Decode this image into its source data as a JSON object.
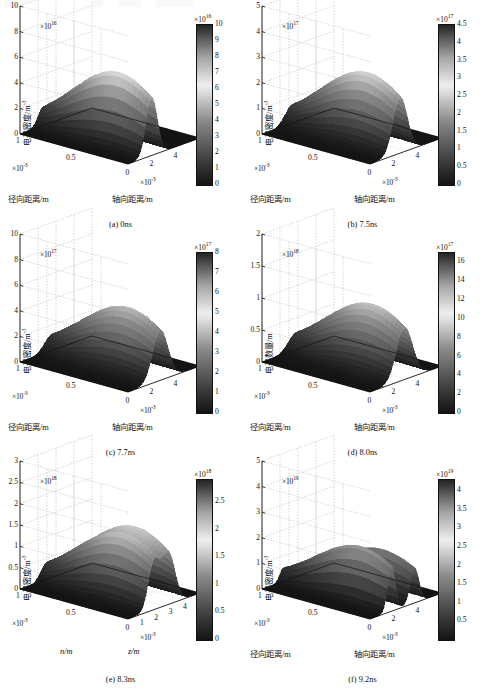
{
  "figure": {
    "type": "multi-panel-3d-surface-grid",
    "rows": 2,
    "cols": 3,
    "colormap": "grayscale-jet",
    "shared": {
      "zlabel": "电子密度/m",
      "zlabel_sup": "-3",
      "radial_label": "径向距离/m",
      "axial_label": "轴向距离/m",
      "radial_exp_text": "×10",
      "radial_exp_sup": "-3",
      "axial_exp_text": "×10",
      "axial_exp_sup": "-3",
      "exp_prefix": "×10"
    }
  },
  "panels": [
    {
      "id": "a",
      "caption": "(a) 0ns",
      "time": "0ns",
      "zlabel": "电子密度/m",
      "zlabel_sup": "-3",
      "xlabel": "径向距离/m",
      "ylabel": "轴向距离/m",
      "z_exp": "16",
      "cb_exp": "16",
      "z_ticks": [
        "0",
        "2",
        "4",
        "6",
        "8",
        "10"
      ],
      "z_values": [
        0,
        2,
        4,
        6,
        8,
        10
      ],
      "radial_ticks": [
        "1",
        "0.5"
      ],
      "axial_ticks": [
        "0",
        "2",
        "4",
        "6"
      ],
      "cb_ticks": [
        "0",
        "1",
        "2",
        "3",
        "4",
        "5",
        "6",
        "7",
        "8",
        "9",
        "10"
      ],
      "cb_range": [
        0,
        10
      ],
      "peaks": [
        {
          "z_center": 0.33,
          "r_center": 0.3,
          "height": 0.58,
          "width": 0.11
        }
      ]
    },
    {
      "id": "b",
      "caption": "(b) 7.5ns",
      "time": "7.5ns",
      "zlabel": "电子密度/m",
      "zlabel_sup": "-3",
      "xlabel": "径向距离/m",
      "ylabel": "轴向距离/m",
      "z_exp": "17",
      "cb_exp": "17",
      "z_ticks": [
        "0",
        "1",
        "2",
        "3",
        "4",
        "5"
      ],
      "z_values": [
        0,
        1,
        2,
        3,
        4,
        5
      ],
      "radial_ticks": [
        "1",
        "0.5"
      ],
      "axial_ticks": [
        "0",
        "2",
        "4",
        "6"
      ],
      "cb_ticks": [
        "0",
        "0.5",
        "1",
        "1.5",
        "2",
        "2.5",
        "3",
        "3.5",
        "4",
        "4.5"
      ],
      "cb_range": [
        0,
        4.5
      ],
      "peaks": [
        {
          "z_center": 0.42,
          "r_center": 0.3,
          "height": 0.56,
          "width": 0.14
        }
      ]
    },
    {
      "id": "c",
      "caption": "(c) 7.7ns",
      "time": "7.7ns",
      "zlabel": "电子密度/m",
      "zlabel_sup": "-3",
      "xlabel": "径向距离/m",
      "ylabel": "轴向距离/m",
      "z_exp": "17",
      "cb_exp": "17",
      "z_ticks": [
        "0",
        "2",
        "4",
        "6",
        "8",
        "10"
      ],
      "z_values": [
        0,
        2,
        4,
        6,
        8,
        10
      ],
      "radial_ticks": [
        "1",
        "0.5"
      ],
      "axial_ticks": [
        "0",
        "2",
        "4",
        "6"
      ],
      "cb_ticks": [
        "0",
        "1",
        "2",
        "3",
        "4",
        "5",
        "6",
        "7",
        "8"
      ],
      "cb_range": [
        0,
        8
      ],
      "peaks": [
        {
          "z_center": 0.45,
          "r_center": 0.3,
          "height": 0.5,
          "width": 0.15
        }
      ]
    },
    {
      "id": "d",
      "caption": "(d) 8.0ns",
      "time": "8.0ns",
      "zlabel": "电子数量/m",
      "zlabel_sup": "",
      "xlabel": "径向距离/m",
      "ylabel": "轴向距离/m",
      "z_exp": "18",
      "cb_exp": "17",
      "z_ticks": [
        "0",
        "0.5",
        "1",
        "1.5",
        "2"
      ],
      "z_values": [
        0,
        0.5,
        1,
        1.5,
        2
      ],
      "radial_ticks": [
        "1",
        "0.5"
      ],
      "axial_ticks": [
        "0",
        "2",
        "4",
        "6"
      ],
      "cb_ticks": [
        "0",
        "2",
        "4",
        "6",
        "8",
        "10",
        "12",
        "14",
        "16"
      ],
      "cb_range": [
        0,
        17
      ],
      "peaks": [
        {
          "z_center": 0.48,
          "r_center": 0.3,
          "height": 0.52,
          "width": 0.16
        }
      ]
    },
    {
      "id": "e",
      "caption": "(e) 8.3ns",
      "time": "8.3ns",
      "zlabel": "电子密度/m",
      "zlabel_sup": "-3",
      "xlabel": "n/m",
      "ylabel": "z/m",
      "xlabel_italic": true,
      "ylabel_italic": true,
      "z_exp": "18",
      "cb_exp": "18",
      "z_ticks": [
        "0",
        "0.5",
        "1",
        "1.5",
        "2",
        "2.5",
        "3"
      ],
      "z_values": [
        0,
        0.5,
        1,
        1.5,
        2,
        2.5,
        3
      ],
      "radial_ticks": [
        "1",
        "0.5"
      ],
      "axial_ticks": [
        "0",
        "1",
        "2",
        "3",
        "4",
        "5"
      ],
      "cb_ticks": [
        "0",
        "0.5",
        "1",
        "1.5",
        "2",
        "2.5"
      ],
      "cb_range": [
        0,
        2.9
      ],
      "peaks": [
        {
          "z_center": 0.36,
          "r_center": 0.3,
          "height": 0.46,
          "width": 0.11
        },
        {
          "z_center": 0.56,
          "r_center": 0.3,
          "height": 0.52,
          "width": 0.13
        }
      ]
    },
    {
      "id": "f",
      "caption": "(f) 9.2ns",
      "time": "9.2ns",
      "zlabel": "电子密度/m",
      "zlabel_sup": "-3",
      "xlabel": "径向距离/m",
      "ylabel": "轴向距离/m",
      "z_exp": "19",
      "cb_exp": "19",
      "z_ticks": [
        "0",
        "1",
        "2",
        "3",
        "4",
        "5"
      ],
      "z_values": [
        0,
        1,
        2,
        3,
        4,
        5
      ],
      "radial_ticks": [
        "1",
        "0.5"
      ],
      "axial_ticks": [
        "0",
        "2",
        "4",
        "6"
      ],
      "cb_ticks": [
        "0.5",
        "1",
        "1.5",
        "2",
        "2.5",
        "3",
        "3.5",
        "4"
      ],
      "cb_range": [
        0,
        4.3
      ],
      "peaks": [
        {
          "z_center": 0.3,
          "r_center": 0.28,
          "height": 0.44,
          "width": 0.075
        },
        {
          "z_center": 0.62,
          "r_center": 0.3,
          "height": 0.35,
          "width": 0.085
        }
      ]
    }
  ],
  "chart_data": {
    "type": "surface",
    "title": "",
    "xlabel": "轴向距离/m (axial distance)",
    "ylabel": "径向距离/m (radial distance)",
    "zlabel": "电子密度/m^-3 (electron density)",
    "series": [
      {
        "name": "(a) 0ns",
        "z_exponent": 16,
        "z_max_tick": 10,
        "peak_value": 6.0,
        "colorbar_max": 10
      },
      {
        "name": "(b) 7.5ns",
        "z_exponent": 17,
        "z_max_tick": 5,
        "peak_value": 3.0,
        "colorbar_max": 4.5
      },
      {
        "name": "(c) 7.7ns",
        "z_exponent": 17,
        "z_max_tick": 10,
        "peak_value": 5.0,
        "colorbar_max": 8
      },
      {
        "name": "(d) 8.0ns",
        "z_exponent": 18,
        "z_max_tick": 2,
        "peak_value": 1.2,
        "colorbar_max": 17
      },
      {
        "name": "(e) 8.3ns",
        "z_exponent": 18,
        "z_max_tick": 3,
        "peak_value": 2.2,
        "colorbar_max": 2.9
      },
      {
        "name": "(f) 9.2ns",
        "z_exponent": 19,
        "z_max_tick": 5,
        "peak_value": 2.2,
        "colorbar_max": 4.3
      }
    ],
    "axis_ranges": {
      "axial_m": [
        0,
        0.006
      ],
      "radial_m": [
        0,
        0.001
      ]
    },
    "grid": true,
    "legend": "none",
    "colorbar_position": "right"
  }
}
